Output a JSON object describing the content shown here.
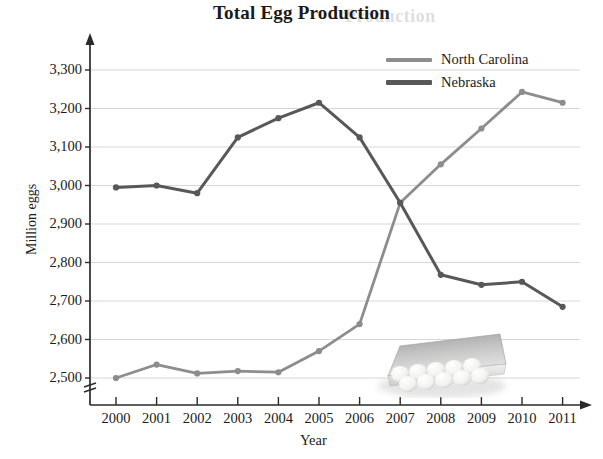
{
  "title": "Total Egg Production",
  "ghost_text": "Production",
  "axis": {
    "xlabel": "Year",
    "ylabel": "Million eggs",
    "break_symbol": "axis-break"
  },
  "legend": {
    "position": "top-right",
    "entries": [
      {
        "label": "North Carolina",
        "color": "#8d8d8d"
      },
      {
        "label": "Nebraska",
        "color": "#585858"
      }
    ]
  },
  "decor": {
    "photo": "egg-carton-photo"
  },
  "chart_data": {
    "type": "line",
    "title": "Total Egg Production",
    "xlabel": "Year",
    "ylabel": "Million eggs",
    "grid": true,
    "legend_position": "top-right",
    "axis_break": true,
    "ylim": [
      2500,
      3300
    ],
    "yticks": [
      2500,
      2600,
      2700,
      2800,
      2900,
      3000,
      3100,
      3200,
      3300
    ],
    "ytick_labels": [
      "2,500",
      "2,600",
      "2,700",
      "2,800",
      "2,900",
      "3,000",
      "3,100",
      "3,200",
      "3,300"
    ],
    "categories": [
      2000,
      2001,
      2002,
      2003,
      2004,
      2005,
      2006,
      2007,
      2008,
      2009,
      2010,
      2011
    ],
    "xtick_labels": [
      "2000",
      "2001",
      "2002",
      "2003",
      "2004",
      "2005",
      "2006",
      "2007",
      "2008",
      "2009",
      "2010",
      "2011"
    ],
    "series": [
      {
        "name": "North Carolina",
        "color": "#8d8d8d",
        "values": [
          2500,
          2535,
          2512,
          2518,
          2515,
          2570,
          2640,
          2955,
          3055,
          3148,
          3243,
          3215
        ]
      },
      {
        "name": "Nebraska",
        "color": "#585858",
        "values": [
          2995,
          3000,
          2980,
          3125,
          3175,
          3215,
          3125,
          2955,
          2768,
          2742,
          2750,
          2685
        ]
      }
    ]
  }
}
